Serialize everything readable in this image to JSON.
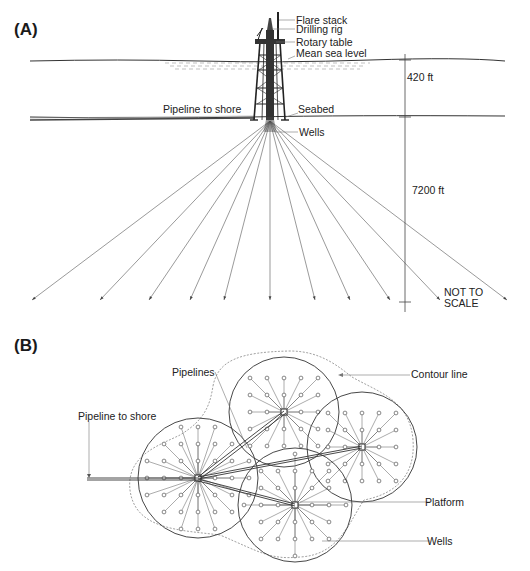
{
  "panelA": {
    "label": "(A)",
    "labels": {
      "flare_stack": "Flare stack",
      "drilling_rig": "Drilling rig",
      "rotary_table": "Rotary table",
      "mean_sea_level": "Mean sea level",
      "pipeline_to_shore": "Pipeline to shore",
      "seabed": "Seabed",
      "wells": "Wells",
      "water_depth": "420 ft",
      "well_depth": "7200 ft",
      "scale_note_line1": "NOT TO",
      "scale_note_line2": "SCALE"
    },
    "geometry": {
      "sea_level_y": 61,
      "seabed_y": 117,
      "fan_origin": [
        270,
        135
      ],
      "well_endpoints_x": [
        32,
        100,
        149,
        190,
        224,
        270,
        315,
        350,
        390,
        440,
        507
      ],
      "well_endpoint_y": 300,
      "dimension_line_x": 408
    }
  },
  "panelB": {
    "label": "(B)",
    "labels": {
      "pipelines": "Pipelines",
      "contour_line": "Contour line",
      "pipeline_to_shore": "Pipeline to shore",
      "platform": "Platform",
      "wells": "Wells"
    },
    "clusters": [
      {
        "name": "west",
        "cx": 198,
        "cy": 478,
        "r": 60
      },
      {
        "name": "north",
        "cx": 284,
        "cy": 412,
        "r": 55
      },
      {
        "name": "east",
        "cx": 362,
        "cy": 447,
        "r": 55
      },
      {
        "name": "south",
        "cx": 295,
        "cy": 505,
        "r": 57
      }
    ],
    "well_spacing": 17
  }
}
